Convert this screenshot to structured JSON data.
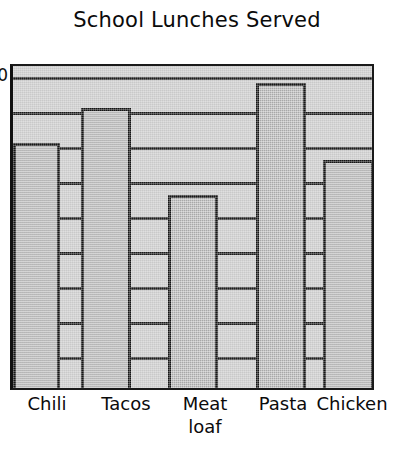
{
  "chart_data": {
    "type": "bar",
    "title": "School Lunches Served",
    "xlabel": "",
    "ylabel": "",
    "categories": [
      "Chili",
      "Tacos",
      "Meat loaf",
      "Pasta",
      "Chicken"
    ],
    "category_lines": [
      [
        "Chili"
      ],
      [
        "Tacos"
      ],
      [
        "Meat",
        "loaf"
      ],
      [
        "Pasta"
      ],
      [
        "Chicken"
      ]
    ],
    "values": [
      7,
      8,
      5.5,
      8.7,
      6.5
    ],
    "ylim": [
      0,
      9.3
    ],
    "grid": true,
    "gridlines_y": [
      9,
      8,
      7,
      6,
      5,
      4,
      3,
      2,
      1
    ],
    "legend": "none",
    "style": "hand-drawn sketch"
  },
  "title": {
    "text": "School Lunches Served"
  },
  "y_axis": {
    "visible_fragment_top": "0",
    "ticks": [
      {
        "label": "0",
        "value": 9.0
      },
      {
        "label": "",
        "value": 8.0
      },
      {
        "label": "",
        "value": 7.0
      },
      {
        "label": "",
        "value": 6.0
      },
      {
        "label": "",
        "value": 5.0
      },
      {
        "label": "",
        "value": 4.0
      },
      {
        "label": "",
        "value": 3.0
      },
      {
        "label": "",
        "value": 2.0
      },
      {
        "label": "",
        "value": 1.0
      }
    ]
  },
  "bars": [
    {
      "name": "chili",
      "label": "Chili",
      "value": 7,
      "left": 0,
      "width": 47,
      "height_px": 240
    },
    {
      "name": "tacos",
      "label": "Tacos",
      "value": 8,
      "left": 68,
      "width": 50,
      "height_px": 278
    },
    {
      "name": "meat-loaf",
      "label": "Meat loaf",
      "value": 5.5,
      "left": 155,
      "width": 50,
      "height_px": 188
    },
    {
      "name": "pasta",
      "label": "Pasta",
      "value": 8.7,
      "left": 243,
      "width": 50,
      "height_px": 301
    },
    {
      "name": "chicken",
      "label": "Chicken",
      "value": 6.5,
      "left": 310,
      "width": 51,
      "height_px": 225
    }
  ],
  "x_labels": [
    {
      "line1": "Chili",
      "line2": "",
      "center": 47
    },
    {
      "line1": "Tacos",
      "line2": "",
      "center": 126
    },
    {
      "line1": "Meat",
      "line2": "loaf",
      "center": 205
    },
    {
      "line1": "Pasta",
      "line2": "",
      "center": 283
    },
    {
      "line1": "Chicken",
      "line2": "",
      "center": 352
    }
  ],
  "colors": {
    "bar_fill": "#a8a8a8",
    "plot_fill": "#c9c9c9",
    "ink": "#141414",
    "background": "#ffffff"
  }
}
